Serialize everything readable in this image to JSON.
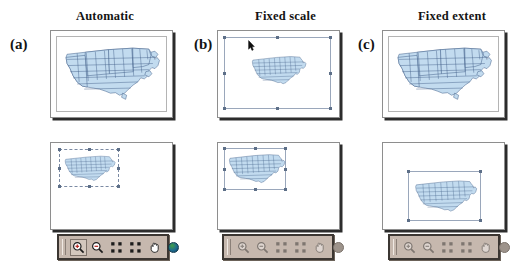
{
  "figure": {
    "columns": [
      {
        "key": "automatic",
        "letter": "(a)",
        "title": "Automatic",
        "before_state": "map drawn at full frame extent, no selection",
        "after_state": "map resized smaller, selection handles shown at upper-left of frame",
        "toolbar_state": "enabled"
      },
      {
        "key": "fixed-scale",
        "letter": "(b)",
        "title": "Fixed scale",
        "before_state": "frame selected with eight handles, map drawn small and centered",
        "after_state": "map selected with eight handles at upper-left of frame",
        "toolbar_state": "disabled"
      },
      {
        "key": "fixed-extent",
        "letter": "(c)",
        "title": "Fixed extent",
        "before_state": "map drawn at full frame extent, no selection",
        "after_state": "map selected with eight handles, centred lower-right in frame",
        "toolbar_state": "disabled"
      }
    ],
    "toolbar": {
      "buttons": [
        {
          "name": "zoom-in",
          "label": "Zoom In",
          "icon": "magnifier-plus-icon",
          "pressed": true
        },
        {
          "name": "zoom-out",
          "label": "Zoom Out",
          "icon": "magnifier-minus-icon",
          "pressed": false
        },
        {
          "name": "zoom-to-extent",
          "label": "Fixed Zoom In",
          "icon": "four-corners-in-icon",
          "pressed": false
        },
        {
          "name": "zoom-out-fixed",
          "label": "Fixed Zoom Out",
          "icon": "four-corners-out-icon",
          "pressed": false
        },
        {
          "name": "pan",
          "label": "Pan",
          "icon": "hand-icon",
          "pressed": false
        },
        {
          "name": "full-extent",
          "label": "Full Extent",
          "icon": "globe-icon",
          "pressed": false
        }
      ],
      "grip_label": "toolbar drag grip"
    },
    "colors": {
      "map_fill": "#c2dbef",
      "map_stroke": "#44618a",
      "frame_border": "#8e8e8e",
      "frame_shadow": "#2c2c2c",
      "toolbar_background": "#c6b8ae",
      "toolbar_border": "#3b3632",
      "selection_handle": "#5d6f88",
      "page_background": "#ffffff"
    }
  }
}
